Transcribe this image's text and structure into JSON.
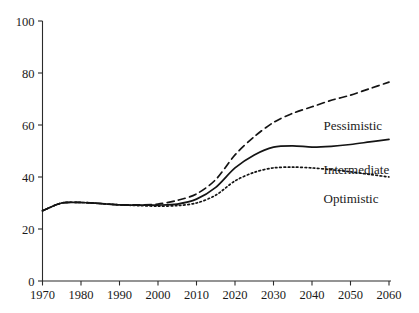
{
  "chart_data": {
    "type": "line",
    "title": "",
    "subtitle": "",
    "xlabel": "",
    "ylabel": "",
    "xlim": [
      1970,
      2060
    ],
    "ylim": [
      0,
      100
    ],
    "grid": false,
    "legend_position": "inline-right",
    "x": [
      1970,
      1975,
      1980,
      1985,
      1990,
      1995,
      2000,
      2005,
      2010,
      2015,
      2020,
      2025,
      2030,
      2035,
      2040,
      2045,
      2050,
      2055,
      2060
    ],
    "xticks": [
      1970,
      1980,
      1990,
      2000,
      2010,
      2020,
      2030,
      2040,
      2050,
      2060
    ],
    "xticklabels": [
      "1970",
      "1980",
      "1990",
      "2000",
      "2010",
      "2020",
      "2030",
      "2040",
      "2050",
      "2060"
    ],
    "yticks": [
      0,
      20,
      40,
      60,
      80,
      100
    ],
    "yticklabels": [
      "0",
      "20",
      "40",
      "60",
      "80",
      "100"
    ],
    "series": [
      {
        "name": "Pessimistic",
        "style": "dashed",
        "color": "#141414",
        "label": "Pessimistic",
        "values": [
          27.0,
          30.0,
          30.2,
          29.8,
          29.3,
          29.3,
          29.6,
          31.0,
          33.5,
          39.0,
          48.5,
          55.5,
          61.0,
          64.5,
          67.0,
          69.5,
          71.5,
          74.0,
          76.5
        ]
      },
      {
        "name": "Intermediate",
        "style": "solid",
        "color": "#141414",
        "label": "Intermediate",
        "values": [
          27.0,
          30.0,
          30.2,
          29.8,
          29.3,
          29.2,
          29.2,
          29.6,
          31.5,
          36.0,
          43.5,
          48.5,
          51.5,
          52.0,
          51.5,
          51.8,
          52.5,
          53.5,
          54.5
        ]
      },
      {
        "name": "Optimistic",
        "style": "dotted",
        "color": "#141414",
        "label": "Optimistic",
        "values": [
          27.0,
          30.0,
          30.2,
          29.8,
          29.3,
          29.0,
          28.8,
          29.0,
          30.0,
          33.0,
          38.5,
          41.8,
          43.5,
          43.8,
          43.5,
          42.8,
          42.0,
          41.0,
          40.0
        ]
      }
    ],
    "series_label_positions": [
      {
        "series": "Pessimistic",
        "x": 2043,
        "y": 58
      },
      {
        "series": "Intermediate",
        "x": 2043,
        "y": 41
      },
      {
        "series": "Optimistic",
        "x": 2043,
        "y": 30
      }
    ]
  }
}
